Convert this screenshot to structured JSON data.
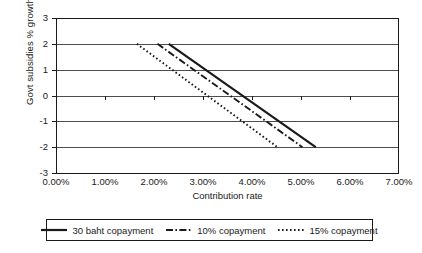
{
  "chart_data": {
    "type": "line",
    "title": "",
    "xlabel": "Contribution rate",
    "ylabel": "Govt subsidies % growth",
    "xlim": [
      0,
      7
    ],
    "ylim": [
      -3,
      3
    ],
    "grid": true,
    "grid_axis": "y",
    "legend_position": "bottom",
    "x_tick_labels": [
      "0.00%",
      "1.00%",
      "2.00%",
      "3.00%",
      "4.00%",
      "5.00%",
      "6.00%",
      "7.00%"
    ],
    "x_tick_values": [
      0,
      1,
      2,
      3,
      4,
      5,
      6,
      7
    ],
    "y_tick_labels": [
      "3",
      "2",
      "1",
      "0",
      "-1",
      "-2",
      "-3"
    ],
    "y_tick_values": [
      3,
      2,
      1,
      0,
      -1,
      -2,
      -3
    ],
    "series": [
      {
        "name": "30 baht copayment",
        "style": "solid",
        "color": "#1a1a1a",
        "x": [
          2.3,
          5.3
        ],
        "y": [
          2,
          -2
        ]
      },
      {
        "name": "10% copayment",
        "style": "dash-dot",
        "color": "#1a1a1a",
        "x": [
          2.07,
          5.03
        ],
        "y": [
          2,
          -2
        ]
      },
      {
        "name": "15% copayment",
        "style": "dotted",
        "color": "#1a1a1a",
        "x": [
          1.65,
          4.52
        ],
        "y": [
          2,
          -2
        ]
      }
    ]
  },
  "legend": {
    "entries": [
      {
        "label": "30 baht copayment",
        "style": "solid"
      },
      {
        "label": "10% copayment",
        "style": "dash-dot"
      },
      {
        "label": "15% copayment",
        "style": "dotted"
      }
    ]
  }
}
